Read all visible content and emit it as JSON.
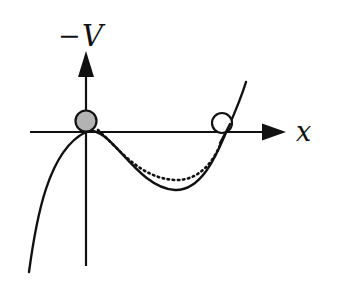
{
  "diagram": {
    "axes": {
      "y_label_sign": "−",
      "y_label_var": "V",
      "x_label": "x"
    },
    "curves": [
      {
        "name": "potential-solid",
        "style": "solid"
      },
      {
        "name": "potential-dotted",
        "style": "dotted"
      }
    ],
    "balls": [
      {
        "name": "ball-origin",
        "fill": "#b3b3b3",
        "position": "origin (local maximum of -V)"
      },
      {
        "name": "ball-right",
        "fill": "#ffffff",
        "position": "right zero crossing"
      }
    ],
    "colors": {
      "line": "#111111",
      "ball_filled": "#b3b3b3",
      "background": "#ffffff"
    }
  }
}
